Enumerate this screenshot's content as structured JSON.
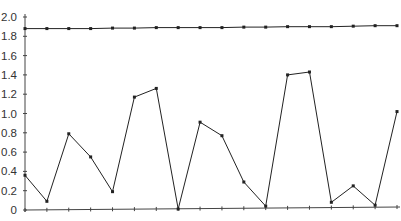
{
  "chart_data": {
    "type": "line",
    "title": "",
    "xlabel": "",
    "ylabel": "",
    "ylim": [
      0,
      2.0
    ],
    "yticks": [
      "0",
      "0.2",
      "0.4",
      "0.6",
      "0.8",
      "1.0",
      "1.2",
      "1.4",
      "1.6",
      "1.8",
      "2.0"
    ],
    "ytick_values": [
      0,
      0.2,
      0.4,
      0.6,
      0.8,
      1.0,
      1.2,
      1.4,
      1.6,
      1.8,
      2.0
    ],
    "x": [
      1,
      2,
      3,
      4,
      5,
      6,
      7,
      8,
      9,
      10,
      11,
      12,
      13,
      14,
      15,
      16,
      17,
      18
    ],
    "xtick_labels_visible": false,
    "grid": false,
    "legend": null,
    "series": [
      {
        "name": "upper",
        "color": "#222222",
        "values": [
          1.88,
          1.88,
          1.88,
          1.88,
          1.885,
          1.885,
          1.89,
          1.89,
          1.89,
          1.89,
          1.895,
          1.895,
          1.9,
          1.9,
          1.9,
          1.905,
          1.91,
          1.91
        ]
      },
      {
        "name": "lower",
        "color": "#222222",
        "values": [
          0.36,
          0.09,
          0.79,
          0.55,
          0.19,
          1.17,
          1.26,
          0.01,
          0.91,
          0.77,
          0.29,
          0.04,
          1.4,
          1.43,
          0.08,
          0.25,
          0.05,
          1.02
        ]
      }
    ]
  }
}
